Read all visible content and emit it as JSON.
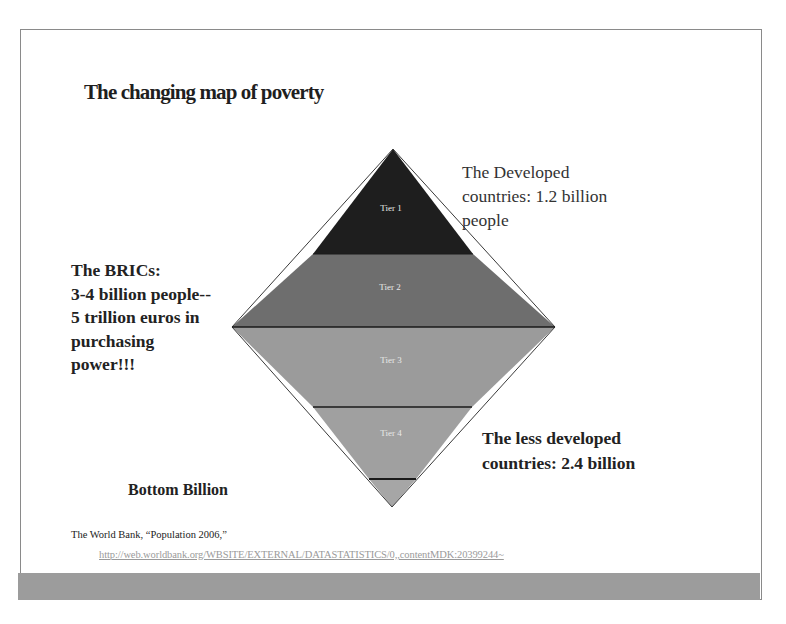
{
  "slide": {
    "title": "The changing map of poverty",
    "pyramid": {
      "tiers": [
        {
          "label": "Tier 1",
          "color": "#1e1e1e"
        },
        {
          "label": "Tier 2",
          "color": "#6e6e6e"
        },
        {
          "label": "Tier 3",
          "color": "#9b9b9b"
        },
        {
          "label": "Tier 4",
          "color": "#a0a0a0"
        },
        {
          "label": "",
          "color": "#a6a6a6"
        }
      ],
      "divider_color": "#1a1a1a"
    },
    "callouts": {
      "developed": [
        "The Developed",
        "countries: 1.2 billion",
        "people"
      ],
      "brics": [
        "The BRICs:",
        "3-4 billion people--",
        "5 trillion euros in",
        "purchasing",
        "power!!!"
      ],
      "less_developed": [
        "The less developed",
        "countries: 2.4 billion"
      ],
      "bottom_billion": "Bottom Billion"
    },
    "citation": {
      "text": "The World Bank, “Population 2006,”",
      "url": "http://web.worldbank.org/WBSITE/EXTERNAL/DATASTATISTICS/0,,contentMDK:20399244~"
    },
    "footer_bar_color": "#9c9c9c"
  }
}
